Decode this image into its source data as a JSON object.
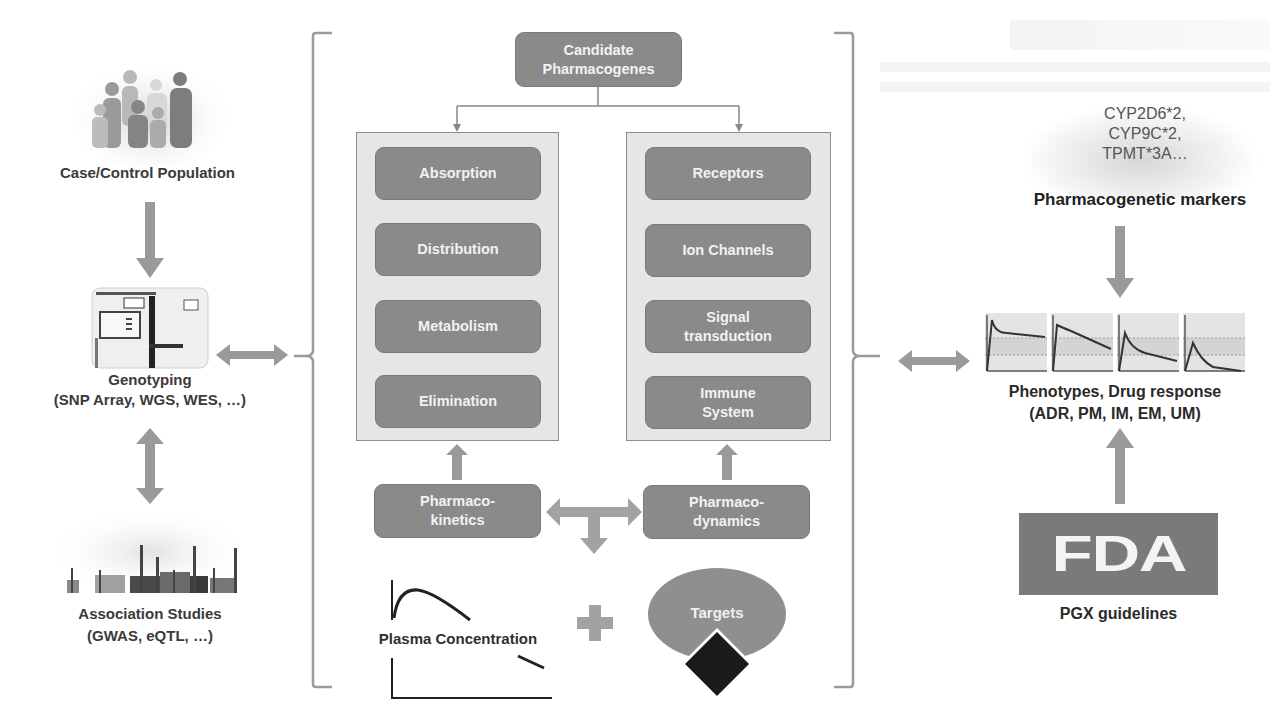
{
  "diagram": {
    "left_column": {
      "population_label": "Case/Control Population",
      "genotyping_title": "Genotyping",
      "genotyping_subtitle": "(SNP Array, WGS, WES, …)",
      "association_title": "Association Studies",
      "association_subtitle": "(GWAS, eQTL, …)"
    },
    "center": {
      "root": "Candidate Pharmacogenes",
      "root_line1": "Candidate",
      "root_line2": "Pharmacogenes",
      "pk_items": [
        {
          "label": "Absorption"
        },
        {
          "label": "Distribution"
        },
        {
          "label": "Metabolism"
        },
        {
          "label": "Elimination"
        }
      ],
      "pd_items": [
        {
          "line1": "Receptors",
          "line2": ""
        },
        {
          "line1": "Ion Channels",
          "line2": ""
        },
        {
          "line1": "Signal",
          "line2": "transduction"
        },
        {
          "line1": "Immune",
          "line2": "System"
        }
      ],
      "pk_line1": "Pharmaco-",
      "pk_line2": "kinetics",
      "pd_line1": "Pharmaco-",
      "pd_line2": "dynamics",
      "plasma_label": "Plasma Concentration",
      "plus_symbol": "+",
      "targets_label": "Targets"
    },
    "right_column": {
      "markers": [
        "CYP2D6*2,",
        "CYP9C*2,",
        "TPMT*3A…"
      ],
      "markers_label": "Pharmacogenetic markers",
      "phenotype_title": "Phenotypes, Drug response",
      "phenotype_subtitle": "(ADR, PM, IM, EM, UM)",
      "fda_logo": "FDA",
      "fda_label": "PGX guidelines"
    },
    "colors": {
      "box_fill": "#8a8a8a",
      "panel_fill": "#e6e6e6",
      "arrow": "#9a9a9a",
      "text_dark": "#3a3a3a",
      "text_light": "#f2f2f2"
    }
  }
}
